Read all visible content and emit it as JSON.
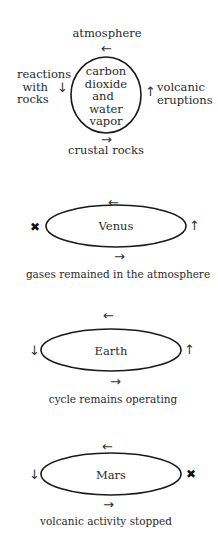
{
  "cycle": {
    "top_label": "atmosphere",
    "bottom_label": "crustal rocks",
    "left_label": [
      "reactions",
      "with",
      "rocks"
    ],
    "right_label": [
      "volcanic",
      "eruptions"
    ],
    "center_lines": [
      "carbon",
      "dioxide",
      "and",
      "water",
      "vapor"
    ],
    "arrows": {
      "top": "←",
      "bottom": "→",
      "left": "↓",
      "right": "↑"
    }
  },
  "planets": [
    {
      "name": "Venus",
      "caption": "gases remained in the atmosphere",
      "left_marker": "✖",
      "right_marker": "↑",
      "top_arrow": "←",
      "bottom_arrow": "→"
    },
    {
      "name": "Earth",
      "caption": "cycle remains operating",
      "left_marker": "↓",
      "right_marker": "↑",
      "top_arrow": "←",
      "bottom_arrow": "→"
    },
    {
      "name": "Mars",
      "caption": "volcanic activity stopped",
      "left_marker": "↓",
      "right_marker": "✖",
      "top_arrow": "←",
      "bottom_arrow": "→"
    }
  ]
}
